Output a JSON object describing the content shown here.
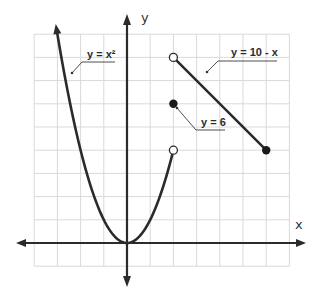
{
  "chart_data": {
    "type": "line",
    "title": "",
    "xlabel": "x",
    "ylabel": "y",
    "grid": true,
    "xlim": [
      -4,
      7
    ],
    "ylim": [
      -1,
      9
    ],
    "unit_px": 23.2,
    "origin_px": [
      127,
      243
    ],
    "series": [
      {
        "name": "y = x²",
        "function": "x^2",
        "domain": [
          -4,
          2
        ],
        "x": [
          -4,
          -3,
          -2,
          -1,
          0,
          1,
          2
        ],
        "y": [
          16,
          9,
          4,
          1,
          0,
          1,
          4
        ],
        "left_end": "arrow",
        "right_end": "open-circle"
      },
      {
        "name": "y = 6",
        "function": "6",
        "domain": [
          2,
          2
        ],
        "x": [
          2
        ],
        "y": [
          6
        ],
        "marker": "filled-circle"
      },
      {
        "name": "y = 10 - x",
        "function": "10 - x",
        "domain": [
          2,
          6
        ],
        "x": [
          2,
          6
        ],
        "y": [
          8,
          4
        ],
        "left_end": "open-circle",
        "right_end": "filled-circle"
      }
    ],
    "annotations": [
      {
        "text": "y = x²",
        "points_to": "left branch of parabola"
      },
      {
        "text": "y = 6",
        "points_to": [
          2,
          6
        ]
      },
      {
        "text": "y = 10 - x",
        "points_to": "line segment"
      }
    ]
  },
  "labels": {
    "x_axis": "x",
    "y_axis": "y",
    "parabola": "y = x²",
    "point": "y = 6",
    "line": "y = 10 - x"
  }
}
